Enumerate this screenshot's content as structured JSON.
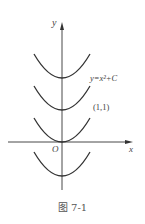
{
  "figure": {
    "caption": "图 7-1",
    "y_axis_label": "y",
    "x_axis_label": "x",
    "origin_label": "O",
    "curve_label": "y=x²+C",
    "point_label": "(1,1)",
    "curves": [
      {
        "name": "y=x^2+C (C>1)",
        "vertex_y_px": 78
      },
      {
        "name": "y=x^2+C (C=1 upper)",
        "vertex_y_px": 110
      },
      {
        "name": "y=x^2",
        "vertex_y_px": 142
      },
      {
        "name": "y=x^2+C (C<0)",
        "vertex_y_px": 176
      }
    ],
    "line_color": "#333333"
  }
}
